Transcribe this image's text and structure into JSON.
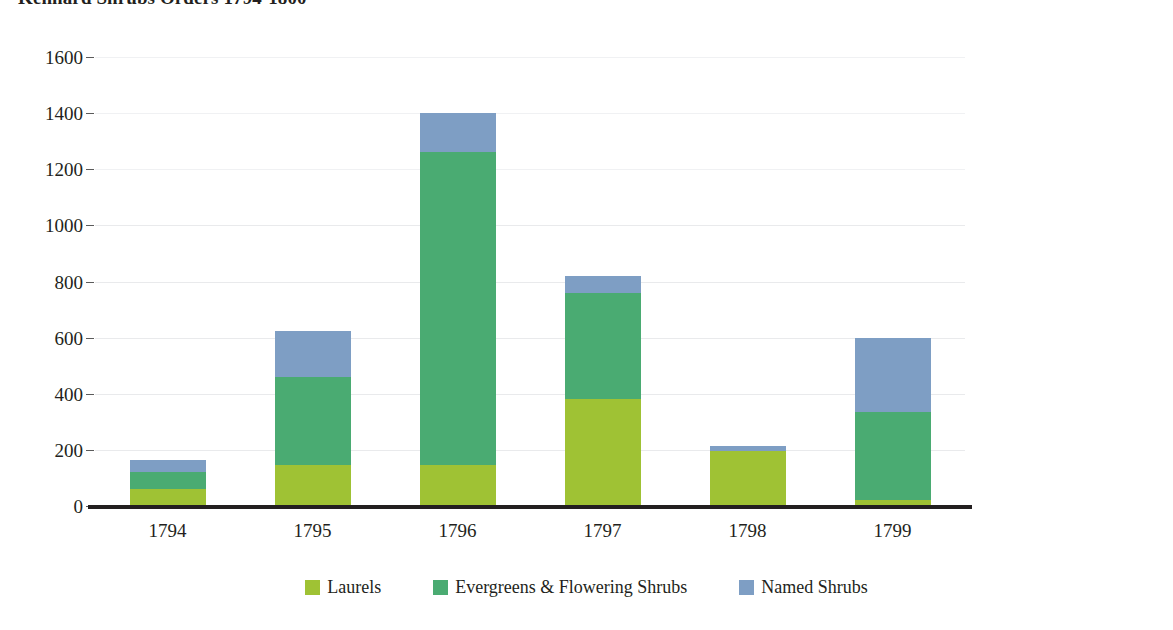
{
  "chart_data": {
    "type": "bar",
    "stacked": true,
    "title": "Kennard Shrubs Orders 1794-1800",
    "xlabel": "",
    "ylabel": "",
    "ylim": [
      0,
      1600
    ],
    "ytick_step": 200,
    "ytick_labels": [
      "1600",
      "1400",
      "1200",
      "1000",
      "800",
      "600",
      "400",
      "200",
      "0"
    ],
    "ytick_values": [
      1600,
      1400,
      1200,
      1000,
      800,
      600,
      400,
      200,
      0
    ],
    "grid": true,
    "legend_position": "bottom",
    "categories": [
      "1794",
      "1795",
      "1796",
      "1797",
      "1798",
      "1799"
    ],
    "series": [
      {
        "name": "Laurels",
        "color": "#9fc234",
        "values": [
          60,
          145,
          145,
          380,
          195,
          20
        ]
      },
      {
        "name": "Evergreens & Flowering Shrubs",
        "color": "#4aab72",
        "values": [
          60,
          315,
          1115,
          380,
          0,
          315
        ]
      },
      {
        "name": "Named Shrubs",
        "color": "#7e9ec4",
        "values": [
          45,
          165,
          140,
          60,
          20,
          265
        ]
      }
    ],
    "totals": [
      165,
      625,
      1400,
      820,
      215,
      600
    ]
  },
  "legend": {
    "items": [
      {
        "label": "Laurels",
        "swatch": "legend-swatch-laurels",
        "color": "#9fc234"
      },
      {
        "label": "Evergreens & Flowering Shrubs",
        "swatch": "legend-swatch-evergreens",
        "color": "#4aab72"
      },
      {
        "label": "Named Shrubs",
        "swatch": "legend-swatch-named",
        "color": "#7e9ec4"
      }
    ]
  }
}
